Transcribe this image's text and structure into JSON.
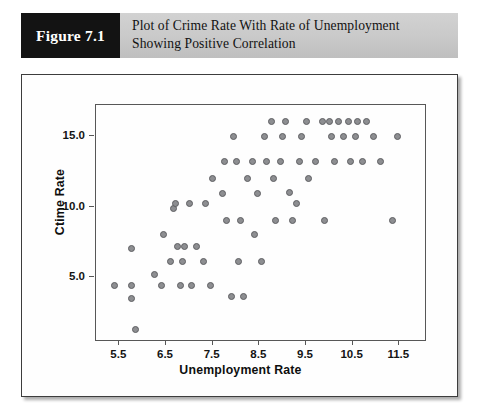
{
  "figure": {
    "badge_label": "Figure 7.1",
    "caption": "Plot of Crime Rate With Rate of Unemployment Showing Positive Correlation"
  },
  "colors": {
    "badge_background": "#131313",
    "caption_background": "#c9c9c9",
    "marker_fill": "#8d8e91",
    "marker_stroke": "#5e5f62",
    "axis": "#575757",
    "panel_border": "#3d3d3d"
  },
  "chart_data": {
    "type": "scatter",
    "title": "",
    "xlabel": "Unemployment Rate",
    "ylabel": "Ctime Rate",
    "xlim": [
      5.0,
      12.05
    ],
    "ylim": [
      0.55,
      17.2
    ],
    "xticks": [
      5.5,
      6.5,
      7.5,
      8.5,
      9.5,
      10.5,
      11.5
    ],
    "xticklabels": [
      "5.5",
      "6.5",
      "7.5",
      "8.5",
      "9.5",
      "10.5",
      "11.5"
    ],
    "yticks": [
      5.0,
      10.0,
      15.0
    ],
    "yticklabels": [
      "5.0",
      "10.0",
      "15.0"
    ],
    "grid": false,
    "legend": null,
    "marker": "circle",
    "points": [
      [
        5.4,
        4.4
      ],
      [
        5.75,
        4.4
      ],
      [
        5.75,
        3.5
      ],
      [
        5.75,
        7.0
      ],
      [
        5.85,
        1.3
      ],
      [
        6.25,
        5.2
      ],
      [
        6.4,
        4.4
      ],
      [
        6.45,
        8.0
      ],
      [
        6.6,
        6.1
      ],
      [
        6.65,
        9.9
      ],
      [
        6.7,
        10.2
      ],
      [
        6.75,
        7.2
      ],
      [
        6.8,
        4.4
      ],
      [
        6.85,
        6.1
      ],
      [
        6.9,
        7.2
      ],
      [
        7.0,
        10.2
      ],
      [
        7.05,
        4.4
      ],
      [
        7.15,
        7.2
      ],
      [
        7.3,
        6.1
      ],
      [
        7.35,
        10.2
      ],
      [
        7.45,
        4.4
      ],
      [
        7.5,
        12.0
      ],
      [
        7.7,
        10.9
      ],
      [
        7.75,
        13.2
      ],
      [
        7.8,
        9.0
      ],
      [
        7.9,
        3.6
      ],
      [
        7.95,
        15.0
      ],
      [
        8.0,
        13.2
      ],
      [
        8.05,
        6.1
      ],
      [
        8.1,
        9.0
      ],
      [
        8.15,
        3.6
      ],
      [
        8.25,
        12.0
      ],
      [
        8.35,
        13.2
      ],
      [
        8.4,
        8.0
      ],
      [
        8.45,
        10.9
      ],
      [
        8.55,
        6.1
      ],
      [
        8.6,
        15.0
      ],
      [
        8.65,
        13.2
      ],
      [
        8.75,
        16.0
      ],
      [
        8.8,
        12.0
      ],
      [
        8.85,
        9.0
      ],
      [
        8.95,
        13.2
      ],
      [
        9.0,
        15.0
      ],
      [
        9.05,
        16.0
      ],
      [
        9.15,
        11.0
      ],
      [
        9.2,
        9.0
      ],
      [
        9.3,
        10.2
      ],
      [
        9.35,
        13.2
      ],
      [
        9.4,
        15.0
      ],
      [
        9.5,
        16.0
      ],
      [
        9.55,
        12.0
      ],
      [
        9.7,
        13.2
      ],
      [
        9.85,
        16.0
      ],
      [
        9.9,
        9.0
      ],
      [
        10.0,
        16.0
      ],
      [
        10.05,
        15.0
      ],
      [
        10.1,
        13.2
      ],
      [
        10.2,
        16.0
      ],
      [
        10.3,
        15.0
      ],
      [
        10.4,
        16.0
      ],
      [
        10.45,
        13.2
      ],
      [
        10.55,
        15.0
      ],
      [
        10.6,
        16.0
      ],
      [
        10.7,
        13.2
      ],
      [
        10.8,
        16.0
      ],
      [
        10.95,
        15.0
      ],
      [
        11.1,
        13.2
      ],
      [
        11.35,
        9.0
      ],
      [
        11.45,
        15.0
      ]
    ]
  }
}
